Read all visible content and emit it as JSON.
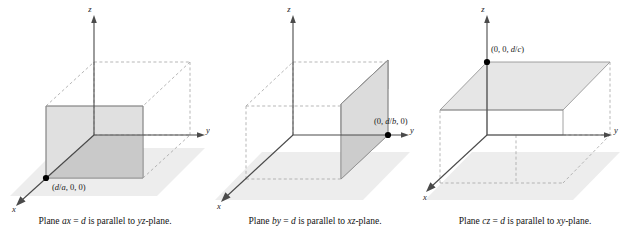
{
  "figure": {
    "title_text": "",
    "background_color": "#ffffff",
    "panel_count": 3
  },
  "colors": {
    "axis": "#3d3d3d",
    "dashed": "#9a9a9a",
    "plane_light": "#e3e3e3",
    "plane_mid": "#d3d3d3",
    "plane_dark": "#bfbfbf",
    "ground": "#ededed",
    "edge": "#8c8c8c",
    "point": "#000000",
    "text": "#111111"
  },
  "panels": [
    {
      "id": "panel-ax-equals-d",
      "caption": "Plane ax = d is parallel to yz-plane.",
      "caption_parts": {
        "lead": "Plane ",
        "equation_italic_a": "a",
        "equation_italic_x": "x",
        "equals": " = ",
        "equation_italic_d": "d",
        "middle": " is parallel to ",
        "plane_name": "yz",
        "tail": "-plane."
      },
      "point_label": "(d/a, 0, 0)",
      "point_label_parts": {
        "open": "(",
        "numerator": "d",
        "slash": "/",
        "denominator": "a",
        "rest": ", 0, 0)"
      },
      "axes": [
        {
          "name": "z-axis-label",
          "label": "z"
        },
        {
          "name": "y-axis-label",
          "label": "y"
        },
        {
          "name": "x-axis-label",
          "label": "x"
        }
      ],
      "plane_orientation": "vertical-parallel-to-yz"
    },
    {
      "id": "panel-by-equals-d",
      "caption": "Plane by = d is parallel to xz-plane.",
      "caption_parts": {
        "lead": "Plane ",
        "equation_italic_a": "b",
        "equation_italic_x": "y",
        "equals": " = ",
        "equation_italic_d": "d",
        "middle": " is parallel to ",
        "plane_name": "xz",
        "tail": "-plane."
      },
      "point_label": "(0, d/b, 0)",
      "point_label_parts": {
        "open": "(0, ",
        "numerator": "d",
        "slash": "/",
        "denominator": "b",
        "rest": ", 0)"
      },
      "axes": [
        {
          "name": "z-axis-label",
          "label": "z"
        },
        {
          "name": "y-axis-label",
          "label": "y"
        },
        {
          "name": "x-axis-label",
          "label": "x"
        }
      ],
      "plane_orientation": "vertical-parallel-to-xz"
    },
    {
      "id": "panel-cz-equals-d",
      "caption": "Plane cz = d is parallel to xy-plane.",
      "caption_parts": {
        "lead": "Plane ",
        "equation_italic_a": "c",
        "equation_italic_x": "z",
        "equals": " = ",
        "equation_italic_d": "d",
        "middle": " is parallel to ",
        "plane_name": "xy",
        "tail": "-plane."
      },
      "point_label": "(0, 0, d/c)",
      "point_label_parts": {
        "open": "(0, 0, ",
        "numerator": "d",
        "slash": "/",
        "denominator": "c",
        "rest": ")"
      },
      "axes": [
        {
          "name": "z-axis-label",
          "label": "z"
        },
        {
          "name": "y-axis-label",
          "label": "y"
        },
        {
          "name": "x-axis-label",
          "label": "x"
        }
      ],
      "plane_orientation": "horizontal-parallel-to-xy"
    }
  ]
}
